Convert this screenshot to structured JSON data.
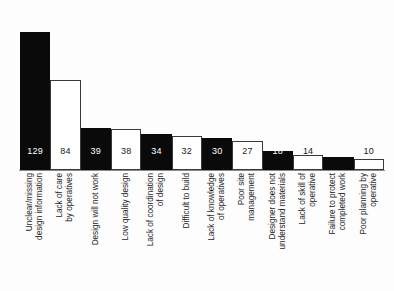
{
  "chart_data": {
    "type": "bar",
    "title": "",
    "subtitle": "",
    "xlabel": "",
    "ylabel": "",
    "ylim": [
      0,
      150
    ],
    "grid": false,
    "legend": false,
    "orientation": "vertical",
    "value_label_position": "inside-bottom",
    "category_label_rotation": -90,
    "categories": [
      "Unclear/missing design information",
      "Lack of care by operatives",
      "Design will not work",
      "Low quality design",
      "Lack of coordination of design",
      "Difficult to build",
      "Lack of knowledge of operatives",
      "Poor site management",
      "Designer does not understand materials",
      "Lack of skill of operative",
      "Failure to protect completed work",
      "Poor planning by operative"
    ],
    "category_lines": [
      [
        "Unclear/missing",
        "design information"
      ],
      [
        "Lack of care",
        "by operatives"
      ],
      [
        "Design will not work"
      ],
      [
        "Low quality design"
      ],
      [
        "Lack of coordination",
        "of design"
      ],
      [
        "Difficult to build"
      ],
      [
        "Lack of knowledge",
        "of operatives"
      ],
      [
        "Poor site",
        "management"
      ],
      [
        "Designer does not",
        "understand materials"
      ],
      [
        "Lack of skill of",
        "operative"
      ],
      [
        "Failure to protect",
        "completed work"
      ],
      [
        "Poor planning by",
        "operative"
      ]
    ],
    "values": [
      129,
      84,
      39,
      38,
      34,
      32,
      30,
      27,
      18,
      14,
      12,
      10
    ],
    "bar_fills": [
      "dark",
      "light",
      "dark",
      "light",
      "dark",
      "light",
      "dark",
      "light",
      "dark",
      "light",
      "dark",
      "light"
    ],
    "colors": {
      "dark_fill": "#0a0a0a",
      "light_fill": "#ffffff",
      "bar_outline": "#3a3a3a",
      "baseline": "#8a8a8a",
      "dark_value_text": "#ffffff",
      "light_value_text": "#1a1a1a",
      "label_text": "#1d1d1d",
      "background": "#fdfdfd"
    }
  }
}
